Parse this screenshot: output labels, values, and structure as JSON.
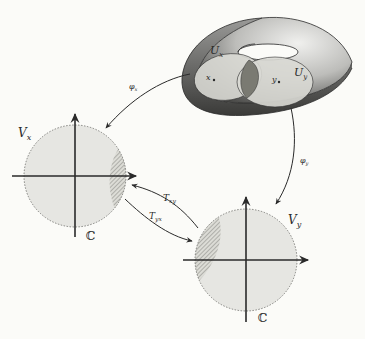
{
  "diagram": {
    "surface": {
      "type": "torus",
      "regions": [
        {
          "id": "Ux",
          "label": "U",
          "subscript": "x",
          "point_label": "x"
        },
        {
          "id": "Uy",
          "label": "U",
          "subscript": "y",
          "point_label": "y"
        }
      ]
    },
    "charts": [
      {
        "id": "Vx",
        "label": "V",
        "subscript": "x",
        "plane_label": "ℂ"
      },
      {
        "id": "Vy",
        "label": "V",
        "subscript": "y",
        "plane_label": "ℂ"
      }
    ],
    "maps": [
      {
        "id": "phi_x",
        "label": "φ",
        "subscript": "x",
        "from": "Ux",
        "to": "Vx"
      },
      {
        "id": "phi_y",
        "label": "φ",
        "subscript": "y",
        "from": "Uy",
        "to": "Vy"
      },
      {
        "id": "T_xy",
        "label": "T",
        "subscript": "xy",
        "from": "Vy",
        "to": "Vx"
      },
      {
        "id": "T_yx",
        "label": "T",
        "subscript": "yx",
        "from": "Vx",
        "to": "Vy"
      }
    ],
    "colors": {
      "torus_dark": "#5a5a5a",
      "torus_light": "#d8d8d8",
      "region_fill": "#d9d9d4",
      "overlap_fill": "#7a7a72",
      "disk_fill": "#e6e6e2",
      "stroke": "#2a2a2a"
    }
  }
}
